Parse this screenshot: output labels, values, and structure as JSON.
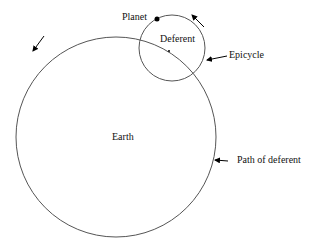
{
  "diagram": {
    "type": "epicycle-model",
    "labels": {
      "planet": "Planet",
      "deferent": "Deferent",
      "epicycle": "Epicycle",
      "earth": "Earth",
      "path_of_deferent": "Path of deferent"
    },
    "deferent_circle": {
      "cx": 116,
      "cy": 137,
      "r": 100
    },
    "epicycle_circle": {
      "cx": 172,
      "cy": 48,
      "r": 33
    },
    "planet_point": {
      "x": 157,
      "y": 19
    },
    "epicycle_center": {
      "x": 169,
      "y": 51
    },
    "colors": {
      "stroke": "#555555",
      "text": "#111111",
      "arrow": "#000000"
    }
  }
}
